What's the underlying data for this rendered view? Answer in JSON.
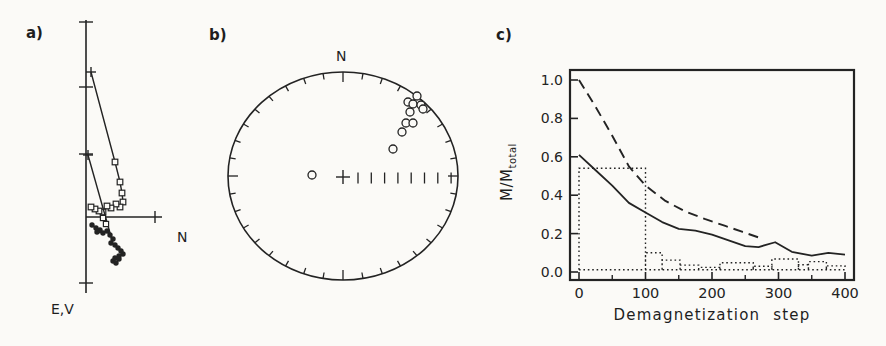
{
  "figure": {
    "background": "#fbfaf7",
    "ink": "#232323",
    "panel_a": {
      "label": "a)",
      "h_axis_label": "N",
      "v_axis_label": "E,V"
    },
    "panel_b": {
      "label": "b)",
      "north_label": "N"
    },
    "panel_c": {
      "label": "c)",
      "xlabel": "Demagnetization step",
      "ylabel_main": "M/M",
      "ylabel_sub": "total"
    }
  },
  "chart_data": [
    {
      "id": "a",
      "type": "line",
      "title": "Orthogonal vector (Zijderveld) demagnetization diagram",
      "axis_labels": {
        "horizontal": "N",
        "vertical": "E,V"
      },
      "axes_px": {
        "v_axis_x": 86,
        "v_axis_y0": 20,
        "v_axis_y1": 293,
        "h_axis_y": 217,
        "h_axis_x0": 86,
        "h_axis_x1": 162,
        "v_ticks_y": [
          22,
          87,
          154,
          283
        ],
        "h_ticks_x": [
          155
        ]
      },
      "series": [
        {
          "name": "declination-path-open-squares",
          "marker": "open-square",
          "start_cross_px": [
            91,
            72
          ],
          "points_px": [
            [
              115,
              162
            ],
            [
              120,
              182
            ],
            [
              122,
              193
            ],
            [
              123,
              202
            ],
            [
              120,
              207
            ],
            [
              116,
              204
            ],
            [
              111,
              208
            ],
            [
              107,
              206
            ],
            [
              103,
              212
            ],
            [
              99,
              211
            ],
            [
              95,
              209
            ],
            [
              91,
              207
            ]
          ]
        },
        {
          "name": "second-component-line",
          "marker": "cross",
          "start_cross_px": [
            88,
            155
          ],
          "end_px": [
            112,
            240
          ],
          "squares_px": [
            [
              103,
              218
            ],
            [
              106,
              224
            ]
          ]
        },
        {
          "name": "inclination-path-filled-circles",
          "marker": "filled-circle",
          "points_px": [
            [
              92,
              225
            ],
            [
              96,
              228
            ],
            [
              100,
              230
            ],
            [
              97,
              232
            ],
            [
              103,
              233
            ],
            [
              107,
              231
            ],
            [
              110,
              235
            ],
            [
              113,
              239
            ],
            [
              111,
              243
            ],
            [
              115,
              245
            ],
            [
              118,
              248
            ],
            [
              121,
              251
            ],
            [
              123,
              254
            ],
            [
              119,
              256
            ],
            [
              115,
              258
            ],
            [
              113,
              261
            ],
            [
              116,
              263
            ],
            [
              119,
              259
            ]
          ]
        }
      ]
    },
    {
      "id": "b",
      "type": "scatter",
      "title": "Equal-area stereonet projection",
      "north_label": "N",
      "rim_px": {
        "cx": 343,
        "cy": 176,
        "rx": 115,
        "ry": 104,
        "tick_step_deg": 10,
        "tick_len": 6,
        "cardinal_tick_len": 10
      },
      "center_cross_px": [
        343,
        177
      ],
      "radial_scale": {
        "y": 178,
        "x_start": 358,
        "x_step": 13.3,
        "count": 8,
        "half_len": 5.5
      },
      "point_radius": 4,
      "points_px": [
        [
          417,
          96
        ],
        [
          408,
          102
        ],
        [
          413,
          104
        ],
        [
          421,
          105
        ],
        [
          423,
          109
        ],
        [
          410,
          112
        ],
        [
          406,
          123
        ],
        [
          413,
          123
        ],
        [
          402,
          132
        ],
        [
          393,
          149
        ],
        [
          312,
          175
        ]
      ]
    },
    {
      "id": "c",
      "type": "line",
      "xlabel": "Demagnetization step",
      "ylabel": "M/M_total",
      "xlim": [
        0,
        400
      ],
      "ylim": [
        0.0,
        1.0
      ],
      "x_ticks": [
        0,
        100,
        200,
        300,
        400
      ],
      "x_minor_ticks": [
        50,
        150,
        250,
        350
      ],
      "y_ticks": [
        0.0,
        0.2,
        0.4,
        0.6,
        0.8,
        1.0
      ],
      "y_tick_labels": [
        "0.0",
        "0.2",
        "0.4",
        "0.6",
        "0.8",
        "1.0"
      ],
      "grid": false,
      "legend": "none",
      "frame_px": {
        "left": 570,
        "right": 854,
        "top": 70,
        "bottom": 280
      },
      "scale": {
        "x0_px": 579,
        "px_per_step": 0.665,
        "y0_px": 272,
        "px_per_unit": 192
      },
      "series": [
        {
          "name": "vector-resultant-dashed",
          "style": "dashed",
          "points": [
            [
              0,
              1.0
            ],
            [
              25,
              0.86
            ],
            [
              50,
              0.71
            ],
            [
              75,
              0.55
            ],
            [
              100,
              0.45
            ],
            [
              130,
              0.37
            ],
            [
              160,
              0.315
            ],
            [
              190,
              0.275
            ],
            [
              220,
              0.24
            ],
            [
              245,
              0.21
            ],
            [
              270,
              0.18
            ]
          ]
        },
        {
          "name": "remanent-intensity-solid",
          "style": "solid",
          "points": [
            [
              0,
              0.61
            ],
            [
              25,
              0.53
            ],
            [
              50,
              0.45
            ],
            [
              75,
              0.36
            ],
            [
              100,
              0.31
            ],
            [
              125,
              0.26
            ],
            [
              150,
              0.225
            ],
            [
              175,
              0.215
            ],
            [
              200,
              0.195
            ],
            [
              225,
              0.165
            ],
            [
              250,
              0.135
            ],
            [
              270,
              0.13
            ],
            [
              295,
              0.155
            ],
            [
              320,
              0.105
            ],
            [
              350,
              0.085
            ],
            [
              375,
              0.1
            ],
            [
              400,
              0.09
            ]
          ]
        }
      ],
      "histogram": {
        "name": "stepwise-difference-dotted",
        "style": "dotted",
        "baseline": 0.012,
        "steps": [
          [
            0,
            100,
            0.54
          ],
          [
            100,
            125,
            0.1
          ],
          [
            125,
            152,
            0.062
          ],
          [
            152,
            180,
            0.036
          ],
          [
            180,
            212,
            0.024
          ],
          [
            212,
            262,
            0.048
          ],
          [
            262,
            290,
            0.03
          ],
          [
            290,
            330,
            0.068
          ],
          [
            330,
            345,
            0.038
          ],
          [
            345,
            372,
            0.054
          ],
          [
            372,
            400,
            0.032
          ]
        ]
      }
    }
  ]
}
